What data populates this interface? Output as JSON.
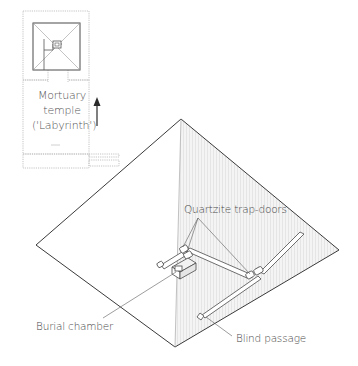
{
  "diagram": {
    "plan": {
      "temple_label_lines": [
        "Mortuary",
        "temple",
        "('Labyrinth')"
      ],
      "north_arrow": "arrow-up-icon"
    },
    "callouts": {
      "trap_doors": "Quartzite trap-doors",
      "burial_chamber": "Burial chamber",
      "blind_passage": "Blind passage"
    },
    "colors": {
      "line": "#3a3a3a",
      "faint_line": "#bdbdbd",
      "shaded_face": "#ececec",
      "text": "#4a4a4a"
    }
  }
}
